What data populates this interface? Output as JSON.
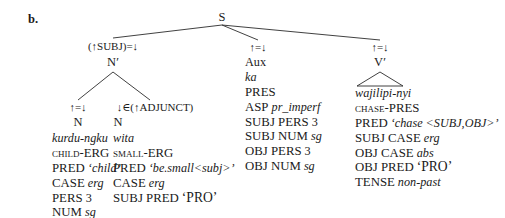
{
  "figure": {
    "example_label": "b.",
    "root": {
      "label": "S"
    }
  },
  "branches": {
    "subj": {
      "annotation": "(↑SUBJ)=↓",
      "category": "N′",
      "children": [
        {
          "annotation": "↑=↓",
          "category": "N",
          "form": "kurdu-ngku",
          "gloss": "child-ERG",
          "features": [
            {
              "attr": "PRED",
              "value": "‘child’"
            },
            {
              "attr": "CASE",
              "value": "erg"
            },
            {
              "attr": "PERS",
              "value": "3"
            },
            {
              "attr": "NUM",
              "value": "sg"
            }
          ]
        },
        {
          "annotation": "↓∈(↑ADJUNCT)",
          "category": "N",
          "form": "wita",
          "gloss": "small-ERG",
          "features": [
            {
              "attr": "PRED",
              "value": "‘be.small<subj>’"
            },
            {
              "attr": "CASE",
              "value": "erg"
            },
            {
              "attr": "SUBJ PRED",
              "value": "‘PRO’"
            }
          ]
        }
      ]
    },
    "aux": {
      "annotation": "↑=↓",
      "category": "Aux",
      "form": "ka",
      "gloss": "PRES",
      "features": [
        {
          "attr": "ASP",
          "value": "pr_imperf"
        },
        {
          "attr": "SUBJ PERS",
          "value": "3"
        },
        {
          "attr": "SUBJ NUM",
          "value": "sg"
        },
        {
          "attr": "OBJ PERS",
          "value": "3"
        },
        {
          "attr": "OBJ NUM",
          "value": "sg"
        }
      ]
    },
    "verb": {
      "annotation": "↑=↓",
      "category": "V′",
      "form": "wajilipi-nyi",
      "gloss": "chase-PRES",
      "features": [
        {
          "attr": "PRED",
          "value": "‘chase <SUBJ,OBJ>’"
        },
        {
          "attr": "SUBJ CASE",
          "value": "erg"
        },
        {
          "attr": "OBJ CASE",
          "value": "abs"
        },
        {
          "attr": "OBJ PRED",
          "value": "‘PRO’"
        },
        {
          "attr": "TENSE",
          "value": "non-past"
        }
      ]
    }
  }
}
